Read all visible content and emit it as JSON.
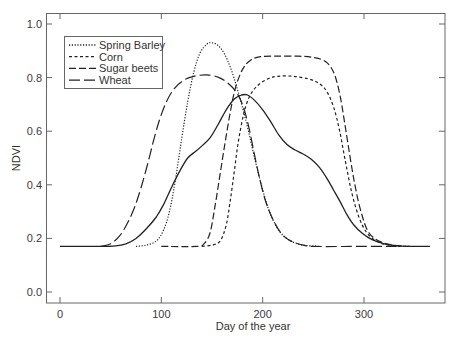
{
  "chart_data": {
    "type": "line",
    "title": "",
    "xlabel": "Day of the year",
    "ylabel": "NDVI",
    "xlim": [
      -12,
      380
    ],
    "ylim": [
      -0.04,
      1.04
    ],
    "xticks": [
      0,
      100,
      200,
      300
    ],
    "yticks": [
      0.0,
      0.2,
      0.4,
      0.6,
      0.8,
      1.0
    ],
    "ytick_labels": [
      "0.0",
      "0.2",
      "0.4",
      "0.6",
      "0.8",
      "1.0"
    ],
    "xtick_labels": [
      "0",
      "100",
      "200",
      "300"
    ],
    "grid": false,
    "legend_position": "upper left",
    "series": [
      {
        "name": "Spring Barley",
        "style": "dotted",
        "in_legend": true,
        "points": [
          [
            75,
            0.17
          ],
          [
            85,
            0.175
          ],
          [
            95,
            0.19
          ],
          [
            102,
            0.23
          ],
          [
            108,
            0.3
          ],
          [
            114,
            0.42
          ],
          [
            120,
            0.57
          ],
          [
            126,
            0.71
          ],
          [
            132,
            0.82
          ],
          [
            138,
            0.89
          ],
          [
            145,
            0.925
          ],
          [
            150,
            0.93
          ],
          [
            156,
            0.92
          ],
          [
            162,
            0.89
          ],
          [
            168,
            0.84
          ],
          [
            174,
            0.77
          ],
          [
            180,
            0.69
          ],
          [
            186,
            0.6
          ],
          [
            192,
            0.5
          ],
          [
            198,
            0.41
          ],
          [
            204,
            0.33
          ],
          [
            210,
            0.27
          ],
          [
            218,
            0.22
          ],
          [
            228,
            0.19
          ],
          [
            240,
            0.175
          ],
          [
            255,
            0.17
          ]
        ]
      },
      {
        "name": "Corn",
        "style": "short-dash",
        "in_legend": true,
        "points": [
          [
            140,
            0.17
          ],
          [
            150,
            0.175
          ],
          [
            158,
            0.19
          ],
          [
            164,
            0.25
          ],
          [
            168,
            0.34
          ],
          [
            172,
            0.45
          ],
          [
            176,
            0.56
          ],
          [
            181,
            0.66
          ],
          [
            187,
            0.73
          ],
          [
            195,
            0.77
          ],
          [
            205,
            0.795
          ],
          [
            215,
            0.805
          ],
          [
            230,
            0.805
          ],
          [
            245,
            0.795
          ],
          [
            255,
            0.78
          ],
          [
            263,
            0.75
          ],
          [
            270,
            0.69
          ],
          [
            276,
            0.6
          ],
          [
            282,
            0.48
          ],
          [
            288,
            0.37
          ],
          [
            295,
            0.28
          ],
          [
            303,
            0.22
          ],
          [
            315,
            0.185
          ],
          [
            330,
            0.172
          ],
          [
            345,
            0.17
          ]
        ]
      },
      {
        "name": "Sugar beets",
        "style": "medium-dash",
        "in_legend": true,
        "points": [
          [
            100,
            0.17
          ],
          [
            135,
            0.17
          ],
          [
            142,
            0.18
          ],
          [
            148,
            0.22
          ],
          [
            153,
            0.32
          ],
          [
            158,
            0.44
          ],
          [
            163,
            0.56
          ],
          [
            168,
            0.67
          ],
          [
            173,
            0.76
          ],
          [
            180,
            0.83
          ],
          [
            188,
            0.865
          ],
          [
            198,
            0.878
          ],
          [
            215,
            0.88
          ],
          [
            235,
            0.88
          ],
          [
            250,
            0.875
          ],
          [
            262,
            0.86
          ],
          [
            270,
            0.82
          ],
          [
            276,
            0.74
          ],
          [
            281,
            0.63
          ],
          [
            286,
            0.51
          ],
          [
            291,
            0.4
          ],
          [
            297,
            0.3
          ],
          [
            305,
            0.22
          ],
          [
            318,
            0.185
          ],
          [
            335,
            0.172
          ],
          [
            345,
            0.17
          ]
        ]
      },
      {
        "name": "Wheat",
        "style": "long-dash",
        "in_legend": true,
        "points": [
          [
            40,
            0.17
          ],
          [
            50,
            0.18
          ],
          [
            59,
            0.21
          ],
          [
            67,
            0.26
          ],
          [
            74,
            0.32
          ],
          [
            80,
            0.39
          ],
          [
            86,
            0.47
          ],
          [
            92,
            0.56
          ],
          [
            98,
            0.64
          ],
          [
            105,
            0.71
          ],
          [
            113,
            0.76
          ],
          [
            122,
            0.79
          ],
          [
            132,
            0.805
          ],
          [
            145,
            0.81
          ],
          [
            157,
            0.8
          ],
          [
            167,
            0.775
          ],
          [
            175,
            0.74
          ],
          [
            181,
            0.69
          ],
          [
            186,
            0.62
          ],
          [
            191,
            0.53
          ],
          [
            196,
            0.44
          ],
          [
            202,
            0.35
          ],
          [
            209,
            0.28
          ],
          [
            218,
            0.22
          ],
          [
            228,
            0.19
          ],
          [
            240,
            0.175
          ],
          [
            252,
            0.17
          ],
          [
            300,
            0.17
          ],
          [
            335,
            0.17
          ]
        ]
      },
      {
        "name": "",
        "style": "solid",
        "in_legend": false,
        "points": [
          [
            0,
            0.17
          ],
          [
            40,
            0.17
          ],
          [
            55,
            0.172
          ],
          [
            65,
            0.18
          ],
          [
            75,
            0.2
          ],
          [
            85,
            0.235
          ],
          [
            95,
            0.28
          ],
          [
            102,
            0.325
          ],
          [
            110,
            0.39
          ],
          [
            118,
            0.45
          ],
          [
            126,
            0.5
          ],
          [
            134,
            0.525
          ],
          [
            140,
            0.545
          ],
          [
            148,
            0.575
          ],
          [
            156,
            0.625
          ],
          [
            164,
            0.68
          ],
          [
            172,
            0.72
          ],
          [
            179,
            0.735
          ],
          [
            185,
            0.735
          ],
          [
            192,
            0.715
          ],
          [
            200,
            0.68
          ],
          [
            208,
            0.635
          ],
          [
            216,
            0.585
          ],
          [
            224,
            0.55
          ],
          [
            232,
            0.53
          ],
          [
            240,
            0.515
          ],
          [
            248,
            0.495
          ],
          [
            256,
            0.465
          ],
          [
            264,
            0.42
          ],
          [
            270,
            0.38
          ],
          [
            276,
            0.34
          ],
          [
            283,
            0.29
          ],
          [
            290,
            0.25
          ],
          [
            298,
            0.22
          ],
          [
            308,
            0.195
          ],
          [
            320,
            0.18
          ],
          [
            335,
            0.172
          ],
          [
            350,
            0.17
          ],
          [
            365,
            0.17
          ]
        ]
      }
    ]
  },
  "legend": {
    "items": [
      {
        "label": "Spring Barley",
        "style": "dotted"
      },
      {
        "label": "Corn",
        "style": "short-dash"
      },
      {
        "label": "Sugar beets",
        "style": "medium-dash"
      },
      {
        "label": "Wheat",
        "style": "long-dash"
      }
    ]
  },
  "colors": {
    "line": "#222222",
    "frame": "#555555",
    "text": "#333333"
  }
}
